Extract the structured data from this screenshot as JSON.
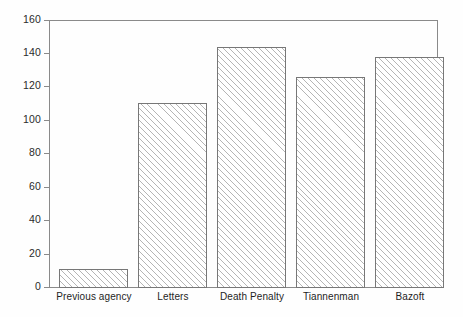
{
  "chart_data": {
    "type": "bar",
    "title": "",
    "subtitle": "",
    "xlabel": "",
    "ylabel": "",
    "categories": [
      "Previous agency",
      "Letters",
      "Death Penalty",
      "Tiannenman",
      "Bazoft"
    ],
    "values": [
      11,
      110,
      144,
      126,
      138
    ],
    "ylim": [
      0,
      160
    ],
    "y_ticks": [
      0,
      20,
      40,
      60,
      80,
      100,
      120,
      140,
      160
    ],
    "y_tick_labels": [
      "0",
      "20",
      "40",
      "60",
      "80",
      "100",
      "120",
      "140",
      "160"
    ],
    "grid": false,
    "legend": null,
    "legend_position": "none",
    "series": [
      {
        "name": "",
        "values": [
          11,
          110,
          144,
          126,
          138
        ]
      }
    ],
    "bar_fill": "hatched-diagonal",
    "bar_edge_color": "#777777",
    "bar_fill_color": "#ffffff",
    "axis_color": "#8a8a8a",
    "background_color": "#ffffff"
  },
  "axis": {
    "y_tick_labels": [
      "160",
      "140",
      "120",
      "100",
      "80",
      "60",
      "40",
      "20",
      "0"
    ]
  },
  "bars": [
    {
      "label": "Previous agency",
      "value": 11
    },
    {
      "label": "Letters",
      "value": 110
    },
    {
      "label": "Death Penalty",
      "value": 144
    },
    {
      "label": "Tiannenman",
      "value": 126
    },
    {
      "label": "Bazoft",
      "value": 138
    }
  ]
}
